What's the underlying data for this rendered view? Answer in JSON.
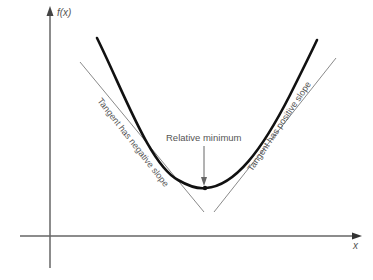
{
  "diagram": {
    "y_axis_label": "f(x)",
    "x_axis_label": "x",
    "annotation": "Relative minimum",
    "left_tangent_label": "Tangent has negative slope",
    "right_tangent_label": "Tangent has positive slope",
    "colors": {
      "curve": "#111111",
      "tangent": "#888888",
      "axis": "#666666",
      "text": "#555555"
    }
  }
}
